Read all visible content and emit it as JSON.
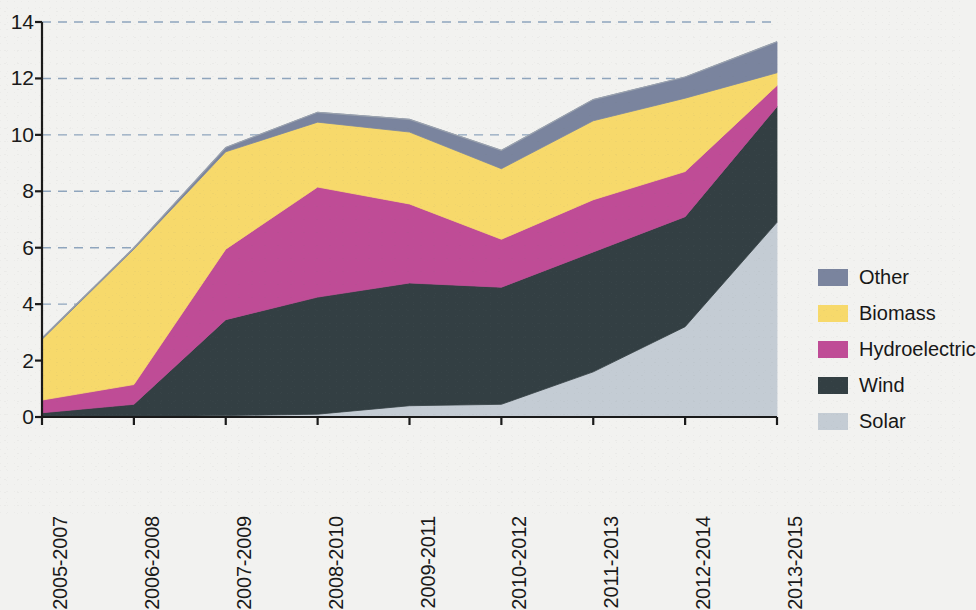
{
  "chart_data": {
    "type": "area",
    "stacked": true,
    "title": "",
    "subtitle": "",
    "xlabel": "",
    "ylabel": "",
    "categories": [
      "2005-2007",
      "2006-2008",
      "2007-2009",
      "2008-2010",
      "2009-2011",
      "2010-2012",
      "2011-2013",
      "2012-2014",
      "2013-2015"
    ],
    "ylim": [
      0,
      14
    ],
    "yticks": [
      0,
      2,
      4,
      6,
      8,
      10,
      12,
      14
    ],
    "ytick_labels": [
      "0",
      "2",
      "4",
      "6",
      "8",
      "10",
      "12",
      "14"
    ],
    "grid": "horizontal-dashed",
    "legend_position": "right",
    "stack_order_bottom_to_top": [
      "Solar",
      "Wind",
      "Hydroelectric",
      "Biomass",
      "Other"
    ],
    "series": [
      {
        "name": "Solar",
        "color": "#c4ccd4",
        "values": [
          0.0,
          0.0,
          0.05,
          0.1,
          0.4,
          0.45,
          1.6,
          3.2,
          6.9
        ]
      },
      {
        "name": "Wind",
        "color": "#333f43",
        "values": [
          0.15,
          0.45,
          3.4,
          4.15,
          4.35,
          4.15,
          4.25,
          3.9,
          4.1
        ]
      },
      {
        "name": "Hydroelectric",
        "color": "#bf4c96",
        "values": [
          0.45,
          0.7,
          2.5,
          3.9,
          2.8,
          1.7,
          1.85,
          1.6,
          0.75
        ]
      },
      {
        "name": "Biomass",
        "color": "#f7d96b",
        "values": [
          2.15,
          4.8,
          3.45,
          2.3,
          2.55,
          2.5,
          2.8,
          2.6,
          0.45
        ]
      },
      {
        "name": "Other",
        "color": "#7a849e",
        "values": [
          0.05,
          0.05,
          0.15,
          0.35,
          0.45,
          0.65,
          0.75,
          0.75,
          1.1
        ]
      }
    ],
    "cumulative_totals": [
      2.8,
      6.0,
      9.55,
      10.8,
      10.55,
      9.45,
      11.25,
      12.05,
      13.3
    ]
  },
  "legend": {
    "items": [
      {
        "label": "Other",
        "color": "#7a849e"
      },
      {
        "label": "Biomass",
        "color": "#f7d96b"
      },
      {
        "label": "Hydroelectric",
        "color": "#bf4c96"
      },
      {
        "label": "Wind",
        "color": "#333f43"
      },
      {
        "label": "Solar",
        "color": "#c4ccd4"
      }
    ]
  },
  "axes": {
    "y_tick_labels": [
      "14",
      "12",
      "10",
      "8",
      "6",
      "4",
      "2",
      "0"
    ],
    "x_tick_labels": [
      "2005-2007",
      "2006-2008",
      "2007-2009",
      "2008-2010",
      "2009-2011",
      "2010-2012",
      "2011-2013",
      "2012-2014",
      "2013-2015"
    ]
  },
  "colors": {
    "background": "#f2f2f0",
    "axis": "#1a1a1a",
    "gridline": "#8fa5bd"
  }
}
